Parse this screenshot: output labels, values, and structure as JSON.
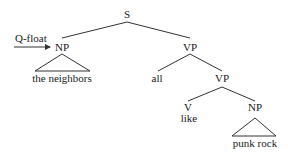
{
  "diagram": {
    "type": "syntax-tree",
    "annotation": {
      "label": "Q-float",
      "points_to": "NP"
    },
    "nodes": {
      "s": "S",
      "np_subject": "NP",
      "np_subject_text": "the neighbors",
      "vp_top": "VP",
      "quantifier": "all",
      "vp_inner": "VP",
      "v": "V",
      "v_text": "like",
      "np_object": "NP",
      "np_object_text": "punk rock"
    },
    "colors": {
      "line": "#333333",
      "text": "#1a1a1a",
      "background": "#ffffff"
    }
  }
}
